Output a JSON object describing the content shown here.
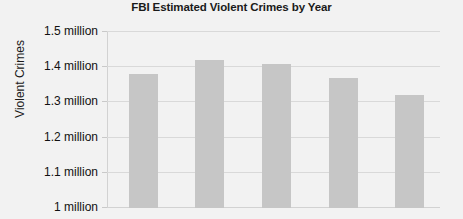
{
  "chart_data": {
    "type": "bar",
    "title": "FBI Estimated Violent Crimes by Year",
    "xlabel": "",
    "ylabel": "Violent Crimes",
    "categories": [
      "",
      "",
      "",
      "",
      ""
    ],
    "values": [
      1380000,
      1420000,
      1410000,
      1370000,
      1320000
    ],
    "ylim": [
      1000000,
      1500000
    ],
    "ytick_values": [
      1500000,
      1400000,
      1300000,
      1200000,
      1100000,
      1000000
    ],
    "ytick_labels": [
      "1.5 million",
      "1.4 million",
      "1.3 million",
      "1.2 million",
      "1.1 million",
      "1 million"
    ],
    "grid": true,
    "legend": false,
    "bar_color": "#c6c6c6",
    "gridline_color": "#d9d9d9",
    "background_color": "#f2f2f2",
    "text_color": "#111111",
    "series": [
      {
        "name": "Violent Crimes",
        "values": [
          1380000,
          1420000,
          1410000,
          1370000,
          1320000
        ],
        "value_labels": [
          "1.38 million",
          "1.42 million",
          "1.41 million",
          "1.37 million",
          "1.32 million"
        ]
      }
    ]
  }
}
